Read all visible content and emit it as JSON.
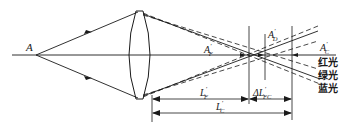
{
  "diagram": {
    "object_point": {
      "label": "A"
    },
    "image_points": [
      {
        "id": "F",
        "main": "A",
        "prime": "′",
        "sub": "F"
      },
      {
        "id": "D",
        "main": "A",
        "prime": "′",
        "sub": "D"
      },
      {
        "id": "C",
        "main": "A",
        "prime": "′",
        "sub": "C"
      }
    ],
    "dimensions": [
      {
        "id": "LF",
        "main": "L",
        "prime": "′",
        "sub": "F"
      },
      {
        "id": "dLFC",
        "main": "ΔL",
        "prime": "′",
        "sub": "FC"
      },
      {
        "id": "LC",
        "main": "L",
        "prime": "′",
        "sub": "C"
      }
    ],
    "legend": [
      {
        "label": "红光",
        "line_style": "dashed",
        "meaning": "red light"
      },
      {
        "label": "绿光",
        "line_style": "solid",
        "meaning": "green light"
      },
      {
        "label": "蓝光",
        "line_style": "dashed",
        "meaning": "blue light"
      }
    ],
    "colors": {
      "ink": "#1a1a1a",
      "background": "#ffffff"
    }
  }
}
